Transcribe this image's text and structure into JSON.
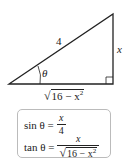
{
  "diagram": {
    "type": "right-triangle",
    "hypotenuse_label": "4",
    "opposite_label": "x",
    "angle_label": "θ",
    "adjacent_label": {
      "radical": "√",
      "radicand": "16 − x",
      "exponent": "2"
    },
    "colors": {
      "stroke": "#222222",
      "box_border": "#bbbbbb"
    }
  },
  "formulas": {
    "sin": {
      "lhs": "sin θ =",
      "numerator": "x",
      "denominator": "4"
    },
    "tan": {
      "lhs": "tan θ =",
      "numerator": "x",
      "denominator_radical": "√",
      "denominator_radicand": "16 − x",
      "denominator_exponent": "2"
    }
  }
}
